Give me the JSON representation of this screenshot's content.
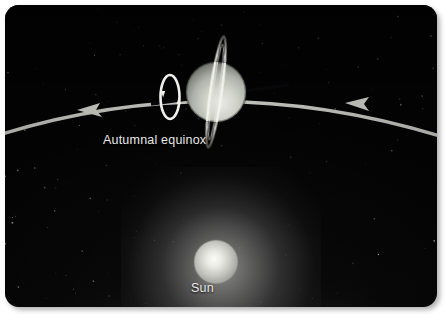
{
  "figure": {
    "background_color": "#070708",
    "panel_radius_px": 14
  },
  "labels": {
    "equinox": "Autumnal equinox",
    "sun": "Sun"
  },
  "bodies": {
    "planet": {
      "name": "ringed planet",
      "center_x": 211,
      "center_y": 87,
      "radius": 30,
      "body_color": "#c9cbc4",
      "shadow_color": "#4a4d49",
      "ring_tilt_deg": 8,
      "ring_color": "#d8d9d2"
    },
    "sun": {
      "name": "sun",
      "center_x": 211,
      "center_y": 257,
      "radius": 22,
      "disc_color": "#cfd0cb",
      "core_color": "#f2f2ee"
    }
  },
  "orbit": {
    "name": "orbital path",
    "color": "#b6b6b0",
    "stroke_width": 3.2,
    "direction": "counterclockwise",
    "arrow_count": 2,
    "arrow_direction": "left"
  },
  "rotation_indicator": {
    "name": "planet rotation direction",
    "center_x": 165,
    "center_y": 92,
    "color": "#f0f0ec"
  },
  "axis_line": {
    "name": "rotation axis",
    "color": "#07070a",
    "tilt_deg": -7
  },
  "stars": {
    "color": "#ffffff",
    "count": 150
  },
  "colors": {
    "page_background": "#ffffff",
    "space": "#070708",
    "label_text": "#e8e8e6",
    "glow": "#e8e8e6"
  }
}
